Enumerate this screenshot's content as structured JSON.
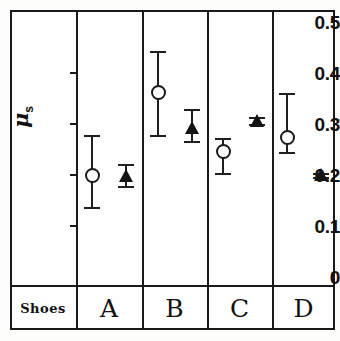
{
  "chart_data": {
    "type": "scatter",
    "title": "",
    "xlabel": "Shoes",
    "ylabel": "μ_s",
    "ylim": [
      0,
      0.5
    ],
    "yticks": [
      0.5,
      0.4,
      0.3,
      0.2,
      0.1,
      0
    ],
    "ytick_labels": [
      "0.5",
      "0.4",
      "0.3",
      "0.2",
      "0.1",
      "0"
    ],
    "categories": [
      "A",
      "B",
      "C",
      "D"
    ],
    "grid": false,
    "legend_position": "none",
    "error_bars": true,
    "series": [
      {
        "name": "open-circle",
        "marker": "open circle",
        "values": [
          0.2,
          0.362,
          0.248,
          0.275
        ],
        "err_low": [
          0.138,
          0.278,
          0.203,
          0.245
        ],
        "err_high": [
          0.278,
          0.443,
          0.272,
          0.36
        ]
      },
      {
        "name": "filled-triangle",
        "marker": "filled triangle",
        "values": [
          0.198,
          0.292,
          0.306,
          0.2
        ],
        "err_low": [
          0.178,
          0.267,
          0.3,
          0.197
        ],
        "err_high": [
          0.222,
          0.33,
          0.313,
          0.203
        ]
      }
    ]
  },
  "axis": {
    "y_label_mu": "μ",
    "y_label_sub": "s",
    "ticks": [
      "0.5",
      "0.4",
      "0.3",
      "0.2",
      "0.1",
      "0"
    ]
  },
  "footer": {
    "header_label": "Shoes",
    "categories": [
      "A",
      "B",
      "C",
      "D"
    ]
  },
  "colors": {
    "ink": "#1a1a1a",
    "marker_fill": "#141414",
    "background": "#fefefe"
  }
}
